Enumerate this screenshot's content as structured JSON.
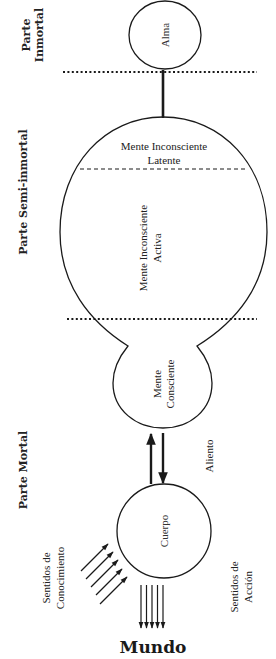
{
  "diagram": {
    "sections": {
      "immortal": {
        "line1": "Parte",
        "line2": "Inmortal"
      },
      "semi_immortal": {
        "label": "Parte Semi-inmortal"
      },
      "mortal": {
        "label": "Parte Mortal"
      }
    },
    "nodes": {
      "soul": {
        "label": "Alma"
      },
      "latent_mind": {
        "line1": "Mente Inconsciente",
        "line2": "Latente"
      },
      "active_mind": {
        "line1": "Mente Inconsciente",
        "line2": "Activa"
      },
      "conscious_mind": {
        "line1": "Mente",
        "line2": "Consciente"
      },
      "body": {
        "label": "Cuerpo"
      }
    },
    "edges": {
      "breath": {
        "label": "Aliento"
      },
      "knowledge_senses": {
        "line1": "Sentidos de",
        "line2": "Conocimiento",
        "arrow_count": 5
      },
      "action_senses": {
        "line1": "Sentidos de",
        "line2": "Acción",
        "arrow_count": 5
      }
    },
    "world": {
      "label": "Mundo"
    },
    "colors": {
      "stroke": "#1a1a1a",
      "text": "#222222",
      "background": "#ffffff"
    }
  }
}
